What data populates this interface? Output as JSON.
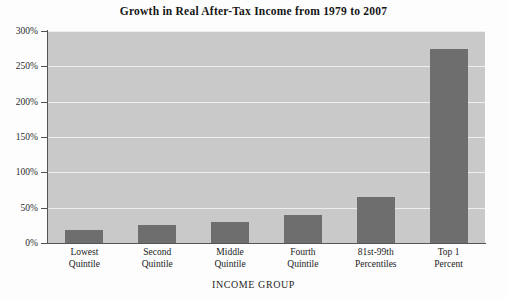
{
  "chart_data": {
    "type": "bar",
    "title": "Growth in Real After-Tax Income from 1979 to 2007",
    "xlabel": "INCOME GROUP",
    "ylabel": "",
    "categories": [
      "Lowest Quintile",
      "Second Quintile",
      "Middle Quintile",
      "Fourth Quintile",
      "81st-99th Percentiles",
      "Top 1 Percent"
    ],
    "category_lines": [
      [
        "Lowest",
        "Quintile"
      ],
      [
        "Second",
        "Quintile"
      ],
      [
        "Middle",
        "Quintile"
      ],
      [
        "Fourth",
        "Quintile"
      ],
      [
        "81st-99th",
        "Percentiles"
      ],
      [
        "Top 1",
        "Percent"
      ]
    ],
    "values": [
      18,
      25,
      30,
      40,
      65,
      275
    ],
    "value_labels": [
      "18%",
      "25%",
      "30%",
      "40%",
      "65%",
      "275%"
    ],
    "ylim": [
      0,
      300
    ],
    "ytick_values": [
      0,
      50,
      100,
      150,
      200,
      250,
      300
    ],
    "ytick_labels": [
      "0%",
      "50%",
      "100%",
      "150%",
      "200%",
      "250%",
      "300%"
    ],
    "grid": true,
    "legend": false,
    "legend_position": "none",
    "bar_color": "#6e6e6e",
    "plot_background": "#c9c9c9",
    "gridline_color": "#eeeeee",
    "axis_color": "#555555"
  }
}
